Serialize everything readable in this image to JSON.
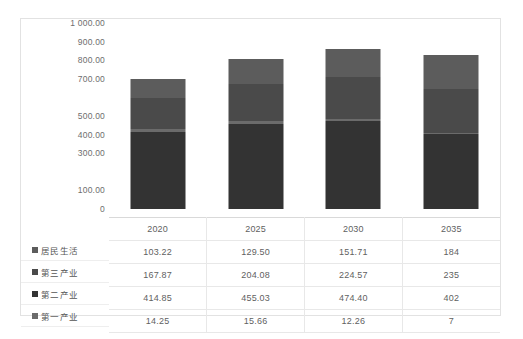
{
  "chart_data": {
    "type": "bar",
    "title": "",
    "xlabel": "",
    "ylabel": "",
    "stacked": true,
    "grid": false,
    "legend_position": "table-left",
    "ylim": [
      0,
      1000
    ],
    "categories": [
      "2020",
      "2025",
      "2030",
      "2035"
    ],
    "y_ticks": [
      "1 000.00",
      "900.00",
      "800.00",
      "700.00",
      "500.00",
      "400.00",
      "300.00",
      "100.00",
      "0"
    ],
    "y_tick_values": [
      1000,
      900,
      800,
      700,
      500,
      400,
      300,
      100,
      0
    ],
    "series": [
      {
        "name": "居民生活",
        "color": "#5c5c5c",
        "values": [
          103.22,
          129.5,
          151.71,
          184
        ],
        "labels": [
          "103.22",
          "129.50",
          "151.71",
          "184"
        ]
      },
      {
        "name": "第三产业",
        "color": "#4a4a4a",
        "values": [
          167.87,
          204.08,
          224.57,
          235
        ],
        "labels": [
          "167.87",
          "204.08",
          "224.57",
          "235"
        ]
      },
      {
        "name": "第二产业",
        "color": "#333333",
        "values": [
          414.85,
          455.03,
          474.4,
          402
        ],
        "labels": [
          "414.85",
          "455.03",
          "474.40",
          "402"
        ]
      },
      {
        "name": "第一产业",
        "color": "#6b6b6b",
        "values": [
          14.25,
          15.66,
          12.26,
          7
        ],
        "labels": [
          "14.25",
          "15.66",
          "12.26",
          "7"
        ]
      }
    ],
    "totals": [
      700.19,
      804.27,
      862.94,
      828
    ]
  },
  "table": {
    "header_row": [
      "2020",
      "2025",
      "2030",
      "2035"
    ],
    "rows": [
      {
        "label": "居民生活",
        "swatch": "#5c5c5c",
        "cells": [
          "103.22",
          "129.50",
          "151.71",
          "184"
        ]
      },
      {
        "label": "第三产业",
        "swatch": "#4a4a4a",
        "cells": [
          "167.87",
          "204.08",
          "224.57",
          "235"
        ]
      },
      {
        "label": "第二产业",
        "swatch": "#333333",
        "cells": [
          "414.85",
          "455.03",
          "474.40",
          "402"
        ]
      },
      {
        "label": "第一产业",
        "swatch": "#6b6b6b",
        "cells": [
          "14.25",
          "15.66",
          "12.26",
          "7"
        ]
      }
    ]
  }
}
